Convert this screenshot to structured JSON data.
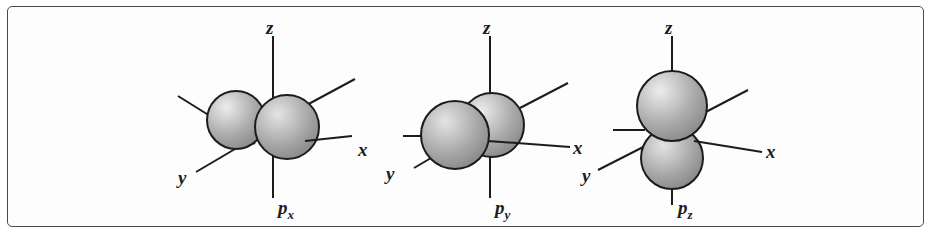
{
  "figure": {
    "kind": "orbital-diagram-set",
    "border_color": "#4a4a4a",
    "background_color": "#fdfdfd"
  },
  "style": {
    "axis_line_color": "#1c1c1c",
    "sphere_outline_color": "#1c1c1c",
    "sphere_highlight_color": "#e8e8e8",
    "sphere_mid_color": "#b0b0b0",
    "sphere_edge_color": "#7d7d7d",
    "label_color": "#1c1c1c"
  },
  "diagrams": [
    {
      "id": "px",
      "orbital_label": "p",
      "orbital_subscript": "x",
      "axes": [
        {
          "name": "z",
          "label": "z"
        },
        {
          "name": "x",
          "label": "x"
        },
        {
          "name": "y",
          "label": "y"
        }
      ]
    },
    {
      "id": "py",
      "orbital_label": "p",
      "orbital_subscript": "y",
      "axes": [
        {
          "name": "z",
          "label": "z"
        },
        {
          "name": "x",
          "label": "x"
        },
        {
          "name": "y",
          "label": "y"
        }
      ]
    },
    {
      "id": "pz",
      "orbital_label": "p",
      "orbital_subscript": "z",
      "axes": [
        {
          "name": "z",
          "label": "z"
        },
        {
          "name": "x",
          "label": "x"
        },
        {
          "name": "y",
          "label": "y"
        }
      ]
    }
  ],
  "labels": {
    "d1_z": "z",
    "d1_x": "x",
    "d1_y": "y",
    "d1_p": "p",
    "d1_psub": "x",
    "d2_z": "z",
    "d2_x": "x",
    "d2_y": "y",
    "d2_p": "p",
    "d2_psub": "y",
    "d3_z": "z",
    "d3_x": "x",
    "d3_y": "y",
    "d3_p": "p",
    "d3_psub": "z"
  }
}
